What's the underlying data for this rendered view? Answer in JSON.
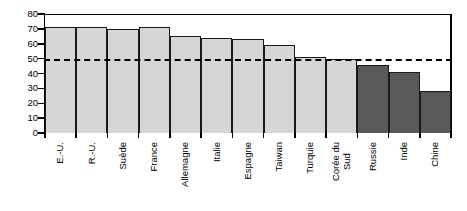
{
  "chart_data": {
    "type": "bar",
    "title": "",
    "xlabel": "",
    "ylabel": "",
    "ylim": [
      0,
      80
    ],
    "yticks": [
      0,
      10,
      20,
      30,
      40,
      50,
      60,
      70,
      80
    ],
    "grid": false,
    "legend": "none",
    "categories": [
      "E.-U.",
      "R.-U.",
      "Suède",
      "France",
      "Allemagne",
      "Italie",
      "Espagne",
      "Taiwan",
      "Turquie",
      "Corée du\nSud",
      "Russie",
      "Inde",
      "Chine"
    ],
    "category_lines": [
      [
        "E.-U."
      ],
      [
        "R.-U."
      ],
      [
        "Suède"
      ],
      [
        "France"
      ],
      [
        "Allemagne"
      ],
      [
        "Italie"
      ],
      [
        "Espagne"
      ],
      [
        "Taiwan"
      ],
      [
        "Turquie"
      ],
      [
        "Corée du",
        "Sud"
      ],
      [
        "Russie"
      ],
      [
        "Inde"
      ],
      [
        "Chine"
      ]
    ],
    "values": [
      71,
      71,
      70,
      71,
      65,
      64,
      63,
      59,
      51,
      50,
      46,
      41,
      28
    ],
    "bar_colors": [
      "#d6d6d6",
      "#d6d6d6",
      "#d6d6d6",
      "#d6d6d6",
      "#d6d6d6",
      "#d6d6d6",
      "#d6d6d6",
      "#d6d6d6",
      "#d6d6d6",
      "#d6d6d6",
      "#595959",
      "#595959",
      "#595959"
    ],
    "annotations": [
      {
        "type": "reference-line",
        "style": "dashed",
        "value": 50,
        "color": "#000000"
      }
    ]
  },
  "colors": {
    "bar_light": "#d6d6d6",
    "bar_dark": "#595959",
    "axis": "#000000",
    "background": "#ffffff"
  }
}
